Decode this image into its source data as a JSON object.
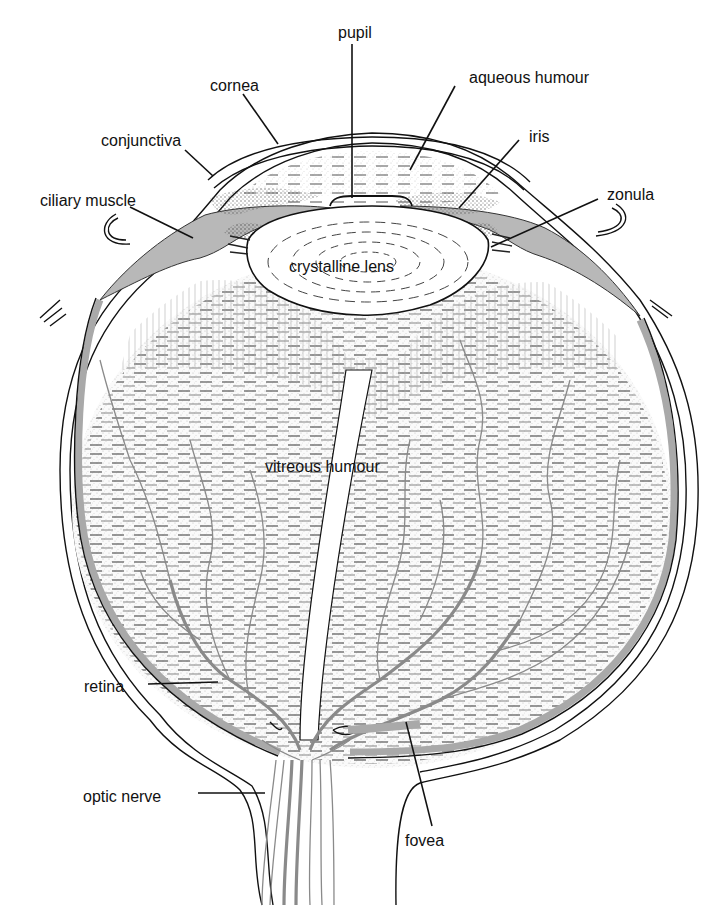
{
  "diagram": {
    "colors": {
      "background": "#ffffff",
      "ink": "#111111",
      "tissue_gray": "#b8b8b8",
      "retina_gray": "#a9a9a9",
      "vessel_gray": "#8a8a8a",
      "stipple": "#d9d9d9"
    },
    "labels": [
      {
        "id": "pupil",
        "text": "pupil",
        "x": 338,
        "y": 38
      },
      {
        "id": "cornea",
        "text": "cornea",
        "x": 210,
        "y": 91
      },
      {
        "id": "aqueous-humour",
        "text": "aqueous humour",
        "x": 469,
        "y": 83
      },
      {
        "id": "conjunctiva",
        "text": "conjunctiva",
        "x": 101,
        "y": 146
      },
      {
        "id": "iris",
        "text": "iris",
        "x": 529,
        "y": 142
      },
      {
        "id": "ciliary-muscle",
        "text": "ciliary muscle",
        "x": 40,
        "y": 206
      },
      {
        "id": "zonula",
        "text": "zonula",
        "x": 607,
        "y": 200
      },
      {
        "id": "crystalline-lens",
        "text": "crystalline lens",
        "x": 289,
        "y": 272
      },
      {
        "id": "vitreous-humour",
        "text": "vitreous humour",
        "x": 265,
        "y": 472
      },
      {
        "id": "retina",
        "text": "retina",
        "x": 84,
        "y": 692
      },
      {
        "id": "optic-nerve",
        "text": "optic nerve",
        "x": 83,
        "y": 802
      },
      {
        "id": "fovea",
        "text": "fovea",
        "x": 405,
        "y": 846
      }
    ]
  }
}
